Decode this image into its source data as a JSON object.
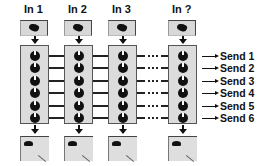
{
  "diagram": {
    "inputs": [
      {
        "label": "In 1"
      },
      {
        "label": "In 2"
      },
      {
        "label": "In 3"
      },
      {
        "label": "In ?"
      }
    ],
    "knobs_per_strip": 6,
    "sends": [
      {
        "label": "Send 1"
      },
      {
        "label": "Send 2"
      },
      {
        "label": "Send 3"
      },
      {
        "label": "Send 4"
      },
      {
        "label": "Send 5"
      },
      {
        "label": "Send 6"
      }
    ],
    "ellipsis": "....",
    "colors": {
      "strip_fill": "#dcdcdc",
      "knob": "#111111",
      "line": "#222222"
    }
  }
}
